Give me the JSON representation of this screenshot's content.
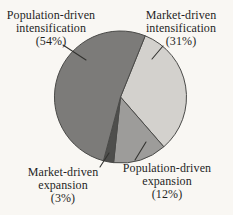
{
  "figure": {
    "background": "#f9f7f3",
    "text_color": "#1f1f1f"
  },
  "chart_data": {
    "type": "pie",
    "title": "",
    "legend": "none",
    "labels_position": "outside-with-leader-lines",
    "start_angle_deg_clockwise_from_top": 22,
    "outline_color": "#4a4a48",
    "leader_color": "#333330",
    "slices": [
      {
        "label": "Market-driven intensification",
        "value_pct": 31,
        "arc_deg": 117,
        "color": "#d3d1cd"
      },
      {
        "label": "Population-driven expansion",
        "value_pct": 12,
        "arc_deg": 47,
        "color": "#9d9c9a"
      },
      {
        "label": "Market-driven expansion",
        "value_pct": 3,
        "arc_deg": 9,
        "color": "#4e4e4c"
      },
      {
        "label": "Population-driven intensification",
        "value_pct": 54,
        "arc_deg": 187,
        "color": "#7c7b79"
      }
    ]
  },
  "labels": {
    "pop_intensification": {
      "line1": "Population-driven",
      "line2": "intensification",
      "line3": "(54%)"
    },
    "market_intensification": {
      "line1": "Market-driven",
      "line2": "intensification",
      "line3": "(31%)"
    },
    "market_expansion": {
      "line1": "Market-driven",
      "line2": "expansion",
      "line3": "(3%)"
    },
    "pop_expansion": {
      "line1": "Population-driven",
      "line2": "expansion",
      "line3": "(12%)"
    }
  }
}
